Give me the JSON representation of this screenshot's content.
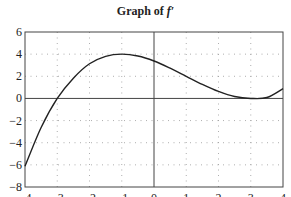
{
  "title": {
    "prefix": "Graph of",
    "func": "f′"
  },
  "chart_data": {
    "type": "line",
    "title": "Graph of f′",
    "xlabel": "",
    "ylabel": "",
    "xlim": [
      -4,
      4
    ],
    "ylim": [
      -8,
      6
    ],
    "x_ticks": [
      -4,
      -3,
      -2,
      -1,
      0,
      1,
      2,
      3,
      4
    ],
    "y_ticks": [
      -8,
      -6,
      -4,
      -2,
      0,
      2,
      4,
      6
    ],
    "x_tick_labels": [
      "−4",
      "−3",
      "−2",
      "−1",
      "0",
      "1",
      "2",
      "3",
      "4"
    ],
    "y_tick_labels": [
      "−8",
      "−6",
      "−4",
      "−2",
      "0",
      "2",
      "4",
      "6"
    ],
    "grid": "dotted",
    "series": [
      {
        "name": "f′",
        "x": [
          -4,
          -3.5,
          -3,
          -2.5,
          -2,
          -1.5,
          -1,
          -0.5,
          0,
          0.5,
          1,
          1.5,
          2,
          2.5,
          3,
          3.5,
          4
        ],
        "values": [
          -6.13,
          -2.63,
          0,
          1.83,
          3.13,
          3.8,
          4,
          3.83,
          3.38,
          2.73,
          2,
          1.27,
          0.63,
          0.17,
          0,
          0.08,
          0.88
        ]
      }
    ],
    "annotations": []
  },
  "colors": {
    "axis": "#444444",
    "grid": "#999999",
    "curve": "#222222"
  }
}
